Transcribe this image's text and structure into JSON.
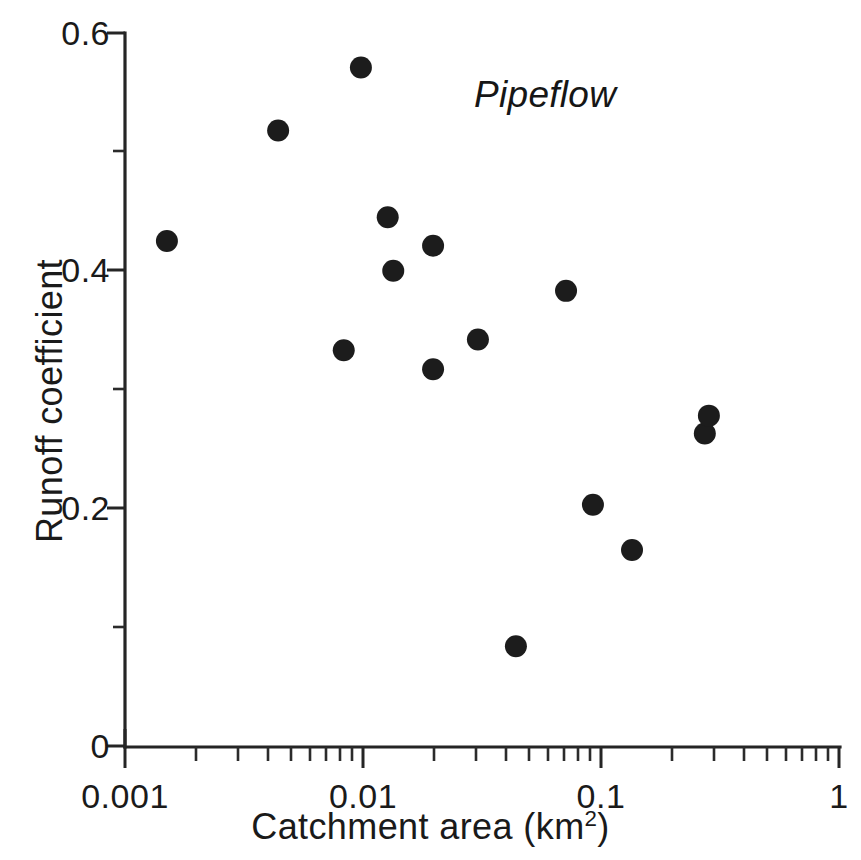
{
  "chart_data": {
    "type": "scatter",
    "title": "",
    "annotation": "Pipeflow",
    "xlabel": "Catchment area (km2)",
    "xlabel_base": "Catchment area (km",
    "xlabel_sup": "2",
    "xlabel_close": ")",
    "ylabel": "Runoff coefficient",
    "xscale": "log",
    "yscale": "linear",
    "xlim": [
      0.001,
      1
    ],
    "ylim": [
      0,
      0.6
    ],
    "grid": false,
    "legend": false,
    "x_tick_labels": [
      "0.001",
      "0.01",
      "0.1",
      "1"
    ],
    "x_tick_values": [
      0.001,
      0.01,
      0.1,
      1
    ],
    "x_minor_ticks_per_decade": [
      2,
      3,
      4,
      5,
      6,
      7,
      8,
      9
    ],
    "y_tick_labels": [
      "0",
      "0.2",
      "0.4",
      "0.6"
    ],
    "y_tick_values": [
      0,
      0.2,
      0.4,
      0.6
    ],
    "y_minor_tick_values": [
      0.1,
      0.3,
      0.5
    ],
    "marker": "filled-circle",
    "marker_color": "#1c1c1c",
    "marker_size_px": 22,
    "series": [
      {
        "name": "Pipeflow",
        "points": [
          {
            "x": 0.0015,
            "y": 0.425
          },
          {
            "x": 0.0044,
            "y": 0.518
          },
          {
            "x": 0.0083,
            "y": 0.333
          },
          {
            "x": 0.0098,
            "y": 0.571
          },
          {
            "x": 0.0127,
            "y": 0.445
          },
          {
            "x": 0.0134,
            "y": 0.4
          },
          {
            "x": 0.0197,
            "y": 0.421
          },
          {
            "x": 0.0197,
            "y": 0.317
          },
          {
            "x": 0.0304,
            "y": 0.342
          },
          {
            "x": 0.0439,
            "y": 0.084
          },
          {
            "x": 0.0713,
            "y": 0.383
          },
          {
            "x": 0.0925,
            "y": 0.203
          },
          {
            "x": 0.135,
            "y": 0.165
          },
          {
            "x": 0.273,
            "y": 0.263
          },
          {
            "x": 0.284,
            "y": 0.278
          }
        ]
      }
    ]
  },
  "axes": {
    "y_labels": [
      "0.6",
      "0.4",
      "0.2",
      "0"
    ],
    "x_labels": [
      "0.001",
      "0.01",
      "0.1",
      "1"
    ]
  }
}
